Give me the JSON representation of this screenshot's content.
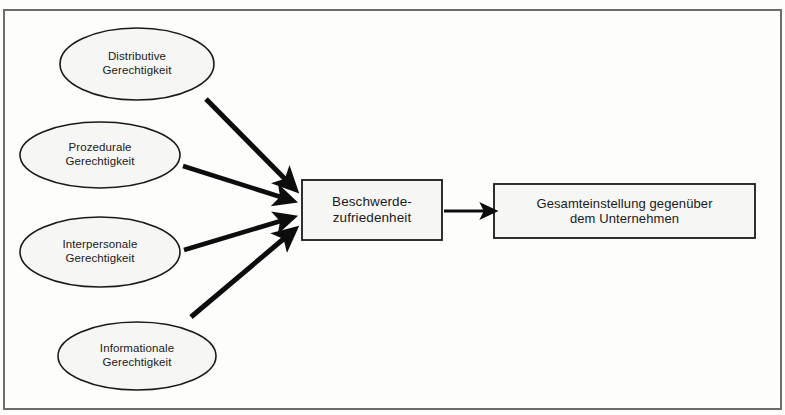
{
  "diagram": {
    "type": "flow-diagram",
    "title": "",
    "frame": {
      "border_color": "#6d6d6d",
      "fill": "#fdfdfc"
    },
    "shape_style": {
      "fill": "#f6f6f4",
      "stroke": "#1a1a1a"
    },
    "nodes": [
      {
        "id": "distributive",
        "shape": "ellipse",
        "line1": "Distributive",
        "line2": "Gerechtigkeit",
        "cx": 137,
        "cy": 64,
        "rx": 77,
        "ry": 36
      },
      {
        "id": "prozedurale",
        "shape": "ellipse",
        "line1": "Prozedurale",
        "line2": "Gerechtigkeit",
        "cx": 100,
        "cy": 155,
        "rx": 80,
        "ry": 33
      },
      {
        "id": "interpersonale",
        "shape": "ellipse",
        "line1": "Interpersonale",
        "line2": "Gerechtigkeit",
        "cx": 100,
        "cy": 252,
        "rx": 80,
        "ry": 35
      },
      {
        "id": "informationale",
        "shape": "ellipse",
        "line1": "Informationale",
        "line2": "Gerechtigkeit",
        "cx": 137,
        "cy": 356,
        "rx": 79,
        "ry": 34
      },
      {
        "id": "beschwerdezufriedenheit",
        "shape": "rect",
        "line1": "Beschwerde-",
        "line2": "zufriedenheit",
        "x": 302,
        "y": 180,
        "w": 140,
        "h": 60
      },
      {
        "id": "gesamteinstellung",
        "shape": "rect",
        "line1": "Gesamteinstellung gegenüber",
        "line2": "dem Unternehmen",
        "x": 494,
        "y": 184,
        "w": 261,
        "h": 54
      }
    ],
    "arrows": [
      {
        "id": "arrow-distributive-to-beschwerde",
        "from": "distributive",
        "to": "beschwerdezufriedenheit",
        "x1": 206,
        "y1": 99,
        "x2": 291,
        "y2": 185,
        "weight": 5
      },
      {
        "id": "arrow-prozedurale-to-beschwerde",
        "from": "prozedurale",
        "to": "beschwerdezufriedenheit",
        "x1": 183,
        "y1": 166,
        "x2": 287,
        "y2": 199,
        "weight": 4.5
      },
      {
        "id": "arrow-interpersonale-to-beschwerde",
        "from": "interpersonale",
        "to": "beschwerdezufriedenheit",
        "x1": 184,
        "y1": 250,
        "x2": 287,
        "y2": 220,
        "weight": 4.5
      },
      {
        "id": "arrow-informationale-to-beschwerde",
        "from": "informationale",
        "to": "beschwerdezufriedenheit",
        "x1": 191,
        "y1": 317,
        "x2": 290,
        "y2": 235,
        "weight": 5
      },
      {
        "id": "arrow-beschwerde-to-gesamteinstellung",
        "from": "beschwerdezufriedenheit",
        "to": "gesamteinstellung",
        "x1": 444,
        "y1": 211,
        "x2": 490,
        "y2": 211,
        "weight": 3.2
      }
    ]
  }
}
